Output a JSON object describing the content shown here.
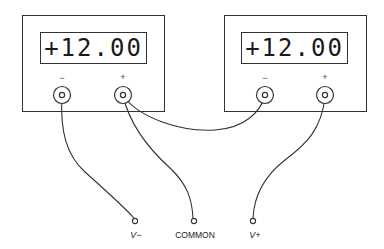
{
  "figure": {
    "type": "two power supplies series-connected to form dual-polarity supply",
    "supplies": [
      {
        "id": "left",
        "display_value": "+12.00",
        "terminals": [
          {
            "polarity": "−",
            "label": "−"
          },
          {
            "polarity": "+",
            "label": "+"
          }
        ]
      },
      {
        "id": "right",
        "display_value": "+12.00",
        "terminals": [
          {
            "polarity": "−",
            "label": "−"
          },
          {
            "polarity": "+",
            "label": "+"
          }
        ]
      }
    ],
    "outputs": [
      {
        "name": "v-minus",
        "label": "V−"
      },
      {
        "name": "common",
        "label": "COMMON"
      },
      {
        "name": "v-plus",
        "label": "V+"
      }
    ],
    "connections": [
      {
        "from": "left.−",
        "to": "V−"
      },
      {
        "from": "left.+",
        "to": "COMMON"
      },
      {
        "from": "left.+",
        "to": "right.−"
      },
      {
        "from": "right.+",
        "to": "V+"
      }
    ],
    "colors": {
      "line": "#333333",
      "background": "#ffffff"
    }
  }
}
